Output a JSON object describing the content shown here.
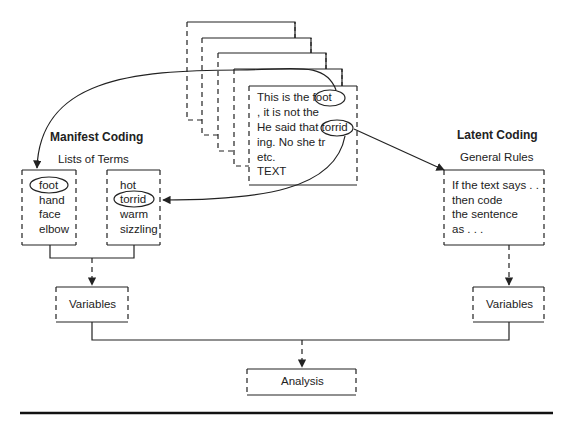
{
  "document": {
    "text_lines": [
      "This is the foot",
      ", it is not the",
      " He said that torrid",
      "ing.  No she tr",
      "etc.",
      "TEXT"
    ],
    "circled_words": [
      "foot",
      "torrid"
    ]
  },
  "manifest": {
    "title": "Manifest Coding",
    "subtitle": "Lists of Terms",
    "list_a": [
      "foot",
      "hand",
      "face",
      "elbow"
    ],
    "list_b": [
      "hot",
      "torrid",
      "warm",
      "sizzling"
    ],
    "variables": "Variables"
  },
  "latent": {
    "title": "Latent Coding",
    "subtitle": "General Rules",
    "rules": [
      "If the text says . . .",
      "then code",
      "the sentence",
      "as . . ."
    ],
    "variables": "Variables"
  },
  "analysis": "Analysis"
}
